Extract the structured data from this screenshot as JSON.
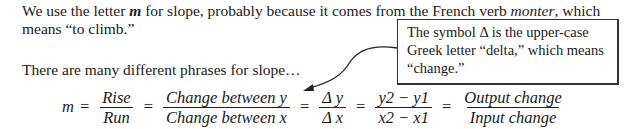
{
  "paragraph1": {
    "line1_pre": "We use the letter ",
    "line1_m": "m",
    "line1_mid": " for slope, probably because it comes from the French verb ",
    "line1_verb": "monter",
    "line1_post": ", which",
    "line2": "means “to climb.”"
  },
  "callout": {
    "lines": [
      "The symbol Δ is the upper-case",
      "Greek letter “delta,” which means",
      "“change.”"
    ]
  },
  "paragraph2": "There are many different phrases for slope…",
  "equation": {
    "lhs": "m",
    "equals": "=",
    "fractions": [
      {
        "num": "Rise",
        "den": "Run"
      },
      {
        "num": "Change between y",
        "den": "Change between x"
      },
      {
        "num": "Δ y",
        "den": "Δ x"
      },
      {
        "num": "y2 − y1",
        "den": "x2 − x1"
      },
      {
        "num": "Output change",
        "den": "Input change"
      }
    ]
  }
}
